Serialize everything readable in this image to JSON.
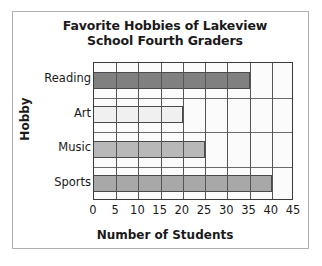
{
  "chart_data": {
    "type": "bar",
    "orientation": "horizontal",
    "title": "Favorite Hobbies of Lakeview School Fourth Graders",
    "title_lines": [
      "Favorite Hobbies of Lakeview",
      "School Fourth Graders"
    ],
    "categories": [
      "Reading",
      "Art",
      "Music",
      "Sports"
    ],
    "values": [
      35,
      20,
      25,
      40
    ],
    "xlabel": "Number of Students",
    "ylabel": "Hobby",
    "xlim": [
      0,
      45
    ],
    "xticks": [
      0,
      5,
      10,
      15,
      20,
      25,
      30,
      35,
      40,
      45
    ],
    "xtick_labels": [
      "0",
      "5",
      "10",
      "15",
      "20",
      "25",
      "30",
      "35",
      "40",
      "45"
    ],
    "grid": true,
    "legend": "none",
    "bar_colors": [
      "#808080",
      "#f0f0f0",
      "#b8b8b8",
      "#a8a8a8"
    ],
    "bars": [
      {
        "category": "Reading",
        "value": 35,
        "color": "#808080"
      },
      {
        "category": "Art",
        "value": 20,
        "color": "#f0f0f0"
      },
      {
        "category": "Music",
        "value": 25,
        "color": "#b8b8b8"
      },
      {
        "category": "Sports",
        "value": 40,
        "color": "#a8a8a8"
      }
    ]
  },
  "style": {
    "frame_color": "#b0b0b0",
    "axis_color": "#3a3a3a",
    "grid_color": "#555555",
    "text_color": "#1a1a1a",
    "plot_background": "#fbfbfb"
  }
}
